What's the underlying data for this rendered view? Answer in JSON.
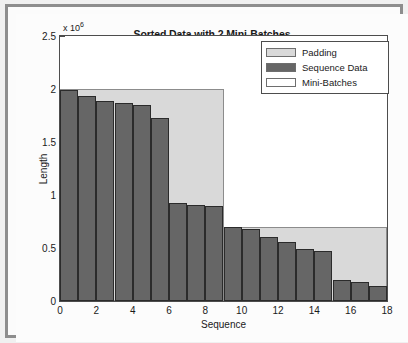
{
  "chart_data": {
    "type": "bar",
    "title": "Sorted Data with 2 Mini-Batches",
    "xlabel": "Sequence",
    "ylabel": "Length",
    "y_multiplier": "x 10",
    "y_multiplier_exponent": "6",
    "xlim": [
      0,
      18
    ],
    "ylim": [
      0,
      2500000
    ],
    "ytick_labels": [
      "0",
      "0.5",
      "1",
      "1.5",
      "2",
      "2.5"
    ],
    "ytick_values": [
      0,
      500000,
      1000000,
      1500000,
      2000000,
      2500000
    ],
    "xtick_labels": [
      "0",
      "2",
      "4",
      "6",
      "8",
      "10",
      "12",
      "14",
      "16",
      "18"
    ],
    "xtick_values": [
      0,
      2,
      4,
      6,
      8,
      10,
      12,
      14,
      16,
      18
    ],
    "grid": false,
    "legend_position": "top-right",
    "legend": [
      {
        "label": "Padding",
        "color": "#d9d9d9"
      },
      {
        "label": "Sequence Data",
        "color": "#666666"
      },
      {
        "label": "Mini-Batches",
        "color": "#ffffff"
      }
    ],
    "categories": [
      0,
      1,
      2,
      3,
      4,
      5,
      6,
      7,
      8,
      9,
      10,
      11,
      12,
      13,
      14,
      15,
      16,
      17
    ],
    "values": [
      1990000,
      1930000,
      1890000,
      1870000,
      1850000,
      1730000,
      920000,
      910000,
      900000,
      700000,
      680000,
      600000,
      560000,
      490000,
      470000,
      200000,
      180000,
      140000
    ],
    "series": [
      {
        "name": "Sequence Data",
        "values": [
          1990000,
          1930000,
          1890000,
          1870000,
          1850000,
          1730000,
          920000,
          910000,
          900000,
          700000,
          680000,
          600000,
          560000,
          490000,
          470000,
          200000,
          180000,
          140000
        ]
      }
    ],
    "mini_batches": [
      {
        "index": 1,
        "x_start": 0,
        "x_end": 9,
        "padding_ceiling": 2000000
      },
      {
        "index": 2,
        "x_start": 9,
        "x_end": 18,
        "padding_ceiling": 700000
      }
    ]
  }
}
